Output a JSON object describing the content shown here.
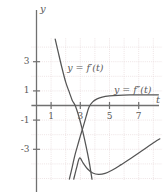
{
  "chart_data": {
    "type": "line",
    "title": "",
    "xlabel": "t",
    "ylabel": "y",
    "xlim": [
      -0.35,
      8.6
    ],
    "ylim": [
      -5.1,
      4.6
    ],
    "grid": true,
    "grid_style": "dotted",
    "legend_position": "inline-annotations",
    "xticks": [
      1,
      3,
      5,
      7
    ],
    "xtick_labels": [
      "1",
      "3",
      "5",
      "7"
    ],
    "yticks": [
      3,
      1,
      -1,
      -3
    ],
    "ytick_labels": [
      "3",
      "1",
      "-1",
      "-3"
    ],
    "annotations": [
      {
        "text": "y = f′(t)",
        "x": 2.1,
        "y": 2.55
      },
      {
        "text": "y = f″(t)",
        "x": 5.3,
        "y": 1.05
      }
    ],
    "series": [
      {
        "name": "y = f'(t)",
        "label": "y = f′(t)",
        "color": "#555555",
        "description": "steep decreasing curve crossing zero near t = 2.65",
        "points": [
          [
            1.28,
            4.55
          ],
          [
            1.5,
            3.6
          ],
          [
            1.75,
            2.55
          ],
          [
            2.0,
            1.6
          ],
          [
            2.25,
            0.9
          ],
          [
            2.45,
            0.35
          ],
          [
            2.65,
            0.0
          ],
          [
            2.9,
            -0.75
          ],
          [
            3.1,
            -1.5
          ],
          [
            3.3,
            -2.35
          ],
          [
            3.5,
            -3.3
          ],
          [
            3.65,
            -4.1
          ],
          [
            3.8,
            -5.05
          ]
        ]
      },
      {
        "name": "y = f''(t)",
        "label": "y = f″(t)",
        "color": "#555555",
        "description": "rises from lower left through zero near t = 3.55 to horizontal asymptote about 0.7",
        "points": [
          [
            2.25,
            -5.05
          ],
          [
            2.45,
            -4.2
          ],
          [
            2.62,
            -3.45
          ],
          [
            2.8,
            -2.8
          ],
          [
            3.0,
            -2.1
          ],
          [
            3.2,
            -1.45
          ],
          [
            3.4,
            -0.75
          ],
          [
            3.6,
            -0.1
          ],
          [
            3.85,
            0.25
          ],
          [
            4.15,
            0.45
          ],
          [
            4.5,
            0.58
          ],
          [
            5.0,
            0.66
          ],
          [
            5.6,
            0.7
          ],
          [
            6.4,
            0.72
          ],
          [
            7.4,
            0.73
          ],
          [
            8.35,
            0.73
          ]
        ]
      },
      {
        "name": "lower-branch",
        "label": "",
        "color": "#555555",
        "description": "lower curve dipping to a minimum near t = 4.2 then rising to the right edge",
        "points": [
          [
            2.55,
            -5.05
          ],
          [
            2.75,
            -4.25
          ],
          [
            2.95,
            -3.6
          ],
          [
            3.2,
            -3.95
          ],
          [
            3.5,
            -4.35
          ],
          [
            3.85,
            -4.62
          ],
          [
            4.25,
            -4.72
          ],
          [
            4.7,
            -4.65
          ],
          [
            5.2,
            -4.42
          ],
          [
            5.8,
            -4.05
          ],
          [
            6.5,
            -3.6
          ],
          [
            7.3,
            -3.05
          ],
          [
            8.1,
            -2.5
          ],
          [
            8.45,
            -2.28
          ]
        ]
      }
    ],
    "colors": {
      "curve": "#555555",
      "axis": "#707070",
      "grid": "#e6d9da",
      "text": "#5a5a5a",
      "background": "#ffffff"
    }
  }
}
